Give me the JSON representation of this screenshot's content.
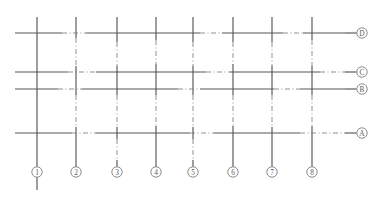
{
  "drawing": {
    "title": "Structural Grid Plan",
    "type": "architectural-grid",
    "canvas": {
      "width": 383,
      "height": 199
    },
    "colors": {
      "background": "#ffffff",
      "line_solid": "#565656",
      "line_dashdot": "#7d7d7d",
      "bubble_stroke": "#6e6e6e",
      "bubble_text": "#5a5a5a"
    },
    "style": {
      "solid_width": 1.15,
      "dash_width": 0.85,
      "dashdot_pattern": "5 2.5 1 2.5",
      "bubble_radius": 5.2
    },
    "extents": {
      "horizontal_start_x": 15,
      "horizontal_end_x": 345,
      "vertical_top_y": 17,
      "vertical_bottom_y": 160,
      "bubble_row_y": 172,
      "bubble_col_x": 362
    }
  },
  "horizontal_axes": [
    {
      "label": "D",
      "y": 33,
      "bubble_cx": 362,
      "leader_from_x": 345,
      "leader_to_x": 356.5,
      "segments": [
        {
          "x1": 15,
          "x2": 62,
          "style": "solid"
        },
        {
          "x1": 62,
          "x2": 86,
          "style": "dashdot"
        },
        {
          "x1": 86,
          "x2": 200,
          "style": "solid"
        },
        {
          "x1": 200,
          "x2": 222,
          "style": "dashdot"
        },
        {
          "x1": 222,
          "x2": 283,
          "style": "solid"
        },
        {
          "x1": 283,
          "x2": 303,
          "style": "dashdot"
        },
        {
          "x1": 303,
          "x2": 345,
          "style": "solid"
        }
      ]
    },
    {
      "label": "C",
      "y": 72,
      "bubble_cx": 362,
      "leader_from_x": 345,
      "leader_to_x": 356.5,
      "segments": [
        {
          "x1": 15,
          "x2": 68,
          "style": "solid"
        },
        {
          "x1": 68,
          "x2": 96,
          "style": "dashdot"
        },
        {
          "x1": 96,
          "x2": 206,
          "style": "solid"
        },
        {
          "x1": 206,
          "x2": 230,
          "style": "dashdot"
        },
        {
          "x1": 230,
          "x2": 320,
          "style": "solid"
        },
        {
          "x1": 320,
          "x2": 345,
          "style": "dashdot"
        }
      ]
    },
    {
      "label": "B",
      "y": 89,
      "bubble_cx": 362,
      "leader_from_x": 345,
      "leader_to_x": 356.5,
      "segments": [
        {
          "x1": 15,
          "x2": 58,
          "style": "solid"
        },
        {
          "x1": 58,
          "x2": 82,
          "style": "dashdot"
        },
        {
          "x1": 82,
          "x2": 178,
          "style": "solid"
        },
        {
          "x1": 178,
          "x2": 200,
          "style": "dashdot"
        },
        {
          "x1": 200,
          "x2": 274,
          "style": "solid"
        },
        {
          "x1": 274,
          "x2": 300,
          "style": "dashdot"
        },
        {
          "x1": 300,
          "x2": 345,
          "style": "solid"
        }
      ]
    },
    {
      "label": "A",
      "y": 133,
      "bubble_cx": 362,
      "leader_from_x": 345,
      "leader_to_x": 356.5,
      "segments": [
        {
          "x1": 15,
          "x2": 72,
          "style": "solid"
        },
        {
          "x1": 72,
          "x2": 96,
          "style": "dashdot"
        },
        {
          "x1": 96,
          "x2": 190,
          "style": "solid"
        },
        {
          "x1": 190,
          "x2": 214,
          "style": "dashdot"
        },
        {
          "x1": 214,
          "x2": 300,
          "style": "solid"
        },
        {
          "x1": 300,
          "x2": 345,
          "style": "dashdot"
        }
      ]
    }
  ],
  "vertical_axes": [
    {
      "label": "1",
      "x": 37,
      "bubble_cy": 172,
      "leader_from_y": 160,
      "leader_to_y": 166.8,
      "tail_to_y": 190,
      "segments": [
        {
          "y1": 17,
          "y2": 160,
          "style": "solid"
        }
      ]
    },
    {
      "label": "2",
      "x": 76,
      "bubble_cy": 172,
      "leader_from_y": 160,
      "leader_to_y": 166.8,
      "tail_to_y": null,
      "segments": [
        {
          "y1": 17,
          "y2": 38,
          "style": "solid"
        },
        {
          "y1": 38,
          "y2": 66,
          "style": "dashdot"
        },
        {
          "y1": 66,
          "y2": 95,
          "style": "solid"
        },
        {
          "y1": 95,
          "y2": 127,
          "style": "dashdot"
        },
        {
          "y1": 127,
          "y2": 160,
          "style": "solid"
        }
      ]
    },
    {
      "label": "3",
      "x": 117,
      "bubble_cy": 172,
      "leader_from_y": 160,
      "leader_to_y": 166.8,
      "tail_to_y": null,
      "segments": [
        {
          "y1": 17,
          "y2": 42,
          "style": "solid"
        },
        {
          "y1": 42,
          "y2": 66,
          "style": "dashdot"
        },
        {
          "y1": 66,
          "y2": 95,
          "style": "solid"
        },
        {
          "y1": 95,
          "y2": 127,
          "style": "dashdot"
        },
        {
          "y1": 127,
          "y2": 139,
          "style": "solid"
        },
        {
          "y1": 139,
          "y2": 160,
          "style": "dashdot"
        }
      ]
    },
    {
      "label": "4",
      "x": 156,
      "bubble_cy": 172,
      "leader_from_y": 160,
      "leader_to_y": 166.8,
      "tail_to_y": null,
      "segments": [
        {
          "y1": 17,
          "y2": 40,
          "style": "solid"
        },
        {
          "y1": 40,
          "y2": 64,
          "style": "dashdot"
        },
        {
          "y1": 64,
          "y2": 95,
          "style": "solid"
        },
        {
          "y1": 95,
          "y2": 126,
          "style": "dashdot"
        },
        {
          "y1": 126,
          "y2": 160,
          "style": "solid"
        }
      ]
    },
    {
      "label": "5",
      "x": 193,
      "bubble_cy": 172,
      "leader_from_y": 160,
      "leader_to_y": 166.8,
      "tail_to_y": null,
      "segments": [
        {
          "y1": 17,
          "y2": 42,
          "style": "solid"
        },
        {
          "y1": 42,
          "y2": 66,
          "style": "dashdot"
        },
        {
          "y1": 66,
          "y2": 95,
          "style": "solid"
        },
        {
          "y1": 95,
          "y2": 127,
          "style": "dashdot"
        },
        {
          "y1": 127,
          "y2": 139,
          "style": "solid"
        },
        {
          "y1": 139,
          "y2": 160,
          "style": "dashdot"
        }
      ]
    },
    {
      "label": "6",
      "x": 233,
      "bubble_cy": 172,
      "leader_from_y": 160,
      "leader_to_y": 166.8,
      "tail_to_y": null,
      "segments": [
        {
          "y1": 17,
          "y2": 42,
          "style": "solid"
        },
        {
          "y1": 42,
          "y2": 64,
          "style": "dashdot"
        },
        {
          "y1": 64,
          "y2": 95,
          "style": "solid"
        },
        {
          "y1": 95,
          "y2": 126,
          "style": "dashdot"
        },
        {
          "y1": 126,
          "y2": 160,
          "style": "solid"
        }
      ]
    },
    {
      "label": "7",
      "x": 272,
      "bubble_cy": 172,
      "leader_from_y": 160,
      "leader_to_y": 166.8,
      "tail_to_y": null,
      "segments": [
        {
          "y1": 17,
          "y2": 42,
          "style": "solid"
        },
        {
          "y1": 42,
          "y2": 66,
          "style": "dashdot"
        },
        {
          "y1": 66,
          "y2": 95,
          "style": "solid"
        },
        {
          "y1": 95,
          "y2": 127,
          "style": "dashdot"
        },
        {
          "y1": 127,
          "y2": 160,
          "style": "solid"
        }
      ]
    },
    {
      "label": "8",
      "x": 312,
      "bubble_cy": 172,
      "leader_from_y": 160,
      "leader_to_y": 166.8,
      "tail_to_y": null,
      "segments": [
        {
          "y1": 17,
          "y2": 40,
          "style": "solid"
        },
        {
          "y1": 40,
          "y2": 66,
          "style": "dashdot"
        },
        {
          "y1": 66,
          "y2": 95,
          "style": "solid"
        },
        {
          "y1": 95,
          "y2": 126,
          "style": "dashdot"
        },
        {
          "y1": 126,
          "y2": 160,
          "style": "solid"
        }
      ]
    }
  ]
}
